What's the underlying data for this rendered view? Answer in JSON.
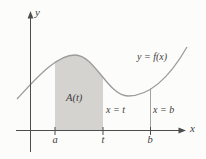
{
  "figure": {
    "background": "#fcfcfa",
    "colors": {
      "axis": "#4d4d4d",
      "curve": "#9b9b9b",
      "region_fill": "#d5d3d0",
      "guide_line": "#a3a3a3",
      "text": "#3c3c3c"
    },
    "labels": {
      "y_axis": "y",
      "x_axis": "x",
      "curve": "y = f(x)",
      "area": "A(t)",
      "line_t": "x = t",
      "line_b": "x = b",
      "tick_a": "a",
      "tick_t": "t",
      "tick_b": "b"
    }
  }
}
